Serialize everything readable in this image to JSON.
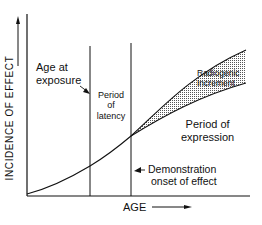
{
  "diagram": {
    "y_axis_label": "INCIDENCE OF EFFECT",
    "x_axis_label": "AGE",
    "annotations": {
      "age_at_exposure_line1": "Age at",
      "age_at_exposure_line2": "exposure",
      "latency_line1": "Period",
      "latency_line2": "of",
      "latency_line3": "latency",
      "radiogenic_line1": "Radiogenic",
      "radiogenic_line2": "Increment",
      "expression_line1": "Period of",
      "expression_line2": "expression",
      "onset_line1": "Demonstration",
      "onset_line2": "onset of effect"
    },
    "colors": {
      "line": "#111111",
      "background": "#ffffff",
      "stipple": "#555555"
    }
  }
}
